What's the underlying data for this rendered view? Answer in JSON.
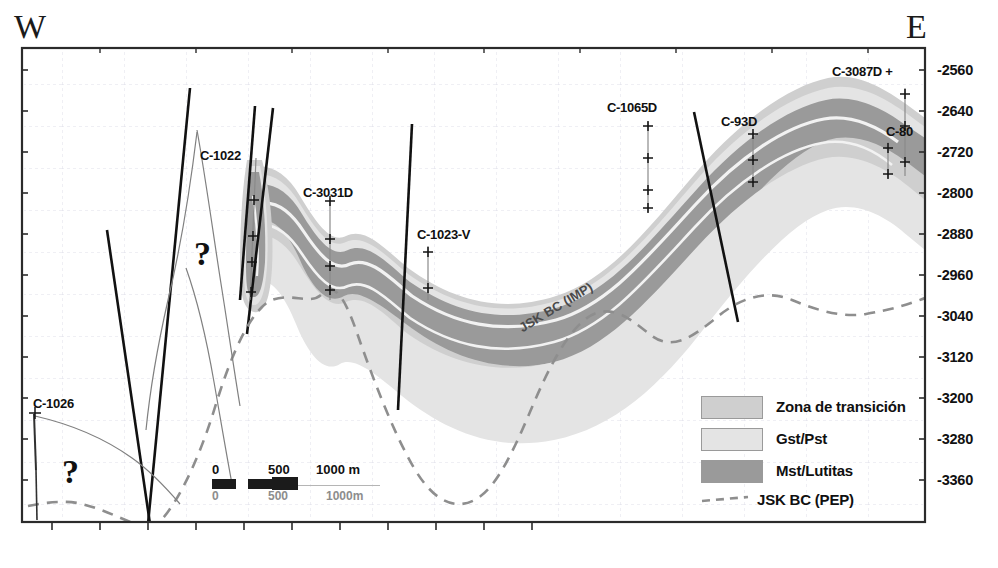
{
  "figure": {
    "type": "geologic-cross-section",
    "orientation_left": "W",
    "orientation_right": "E"
  },
  "axes": {
    "depth_unit": "m",
    "depth_labels": [
      "-2560",
      "-2640",
      "-2720",
      "-2800",
      "-2880",
      "-2960",
      "-3040",
      "-3120",
      "-3200",
      "-3280",
      "-3360"
    ],
    "depth_values": [
      -2560,
      -2640,
      -2720,
      -2800,
      -2880,
      -2960,
      -3040,
      -3120,
      -3200,
      -3280,
      -3360
    ],
    "depth_step": 80,
    "bottom_axis_ticks": 11,
    "left_axis_ticks": 11
  },
  "wells": [
    {
      "name": "C-1026",
      "label_x": 33,
      "label_y": 396
    },
    {
      "name": "C-1022",
      "label_x": 200,
      "label_y": 148
    },
    {
      "name": "C-3031D",
      "label_x": 303,
      "label_y": 185
    },
    {
      "name": "C-1023-V",
      "label_x": 417,
      "label_y": 227
    },
    {
      "name": "C-1065D",
      "label_x": 607,
      "label_y": 100
    },
    {
      "name": "C-93D",
      "label_x": 721,
      "label_y": 114
    },
    {
      "name": "C-3087D +",
      "label_x": 832,
      "label_y": 64
    },
    {
      "name": "C-80",
      "label_x": 886,
      "label_y": 124
    }
  ],
  "annotations": {
    "horizon_imp": "JSK BC (IMP)",
    "question_mark_left": "?",
    "question_mark_center": "?"
  },
  "legend": {
    "items": [
      {
        "label": "Zona de transición",
        "swatch": "#cfcfcf",
        "kind": "fill"
      },
      {
        "label": "Gst/Pst",
        "swatch": "#e4e4e4",
        "kind": "fill"
      },
      {
        "label": "Mst/Lutitas",
        "swatch": "#9a9a9a",
        "kind": "fill"
      },
      {
        "label": "JSK BC (PEP)",
        "swatch": "#8e8e8e",
        "kind": "dashed-line"
      }
    ]
  },
  "scale_bar": {
    "top_labels": [
      "0",
      "500",
      "1000 m"
    ],
    "bottom_labels": [
      "0",
      "500",
      "1000m"
    ]
  },
  "colors": {
    "zona_transicion": "#cfcfcf",
    "gst_pst": "#e4e4e4",
    "mst_lutitas": "#9a9a9a",
    "fault_line": "#111111",
    "pep_dashed": "#8e8e8e",
    "frame": "#2b2b2b",
    "grid": "#d9d9e4"
  }
}
